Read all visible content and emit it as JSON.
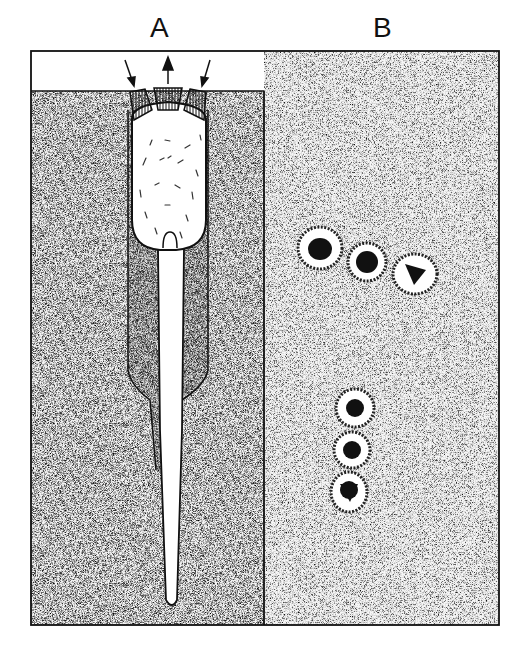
{
  "figure": {
    "panels": [
      {
        "id": "A",
        "label": "A",
        "description": "Longitudinal section of a cell in substrate with three capping plates and arrows at top; elongated body tapering into a long tube"
      },
      {
        "id": "B",
        "label": "B",
        "description": "Two chains of three rounded cells each with dark nuclei, on stippled background"
      }
    ],
    "colors": {
      "ink": "#111111",
      "stipple_bg": "#e6e6e6",
      "paper": "#ffffff"
    }
  }
}
